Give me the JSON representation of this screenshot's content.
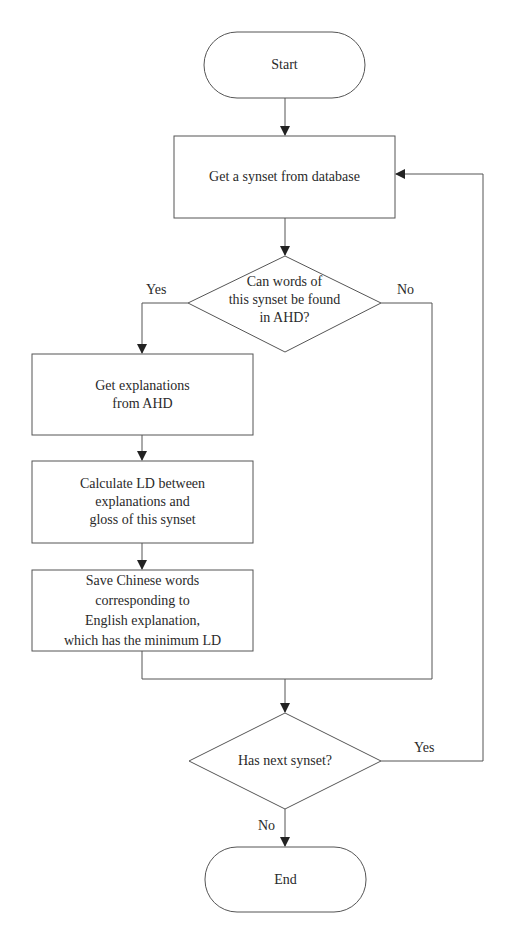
{
  "flowchart": {
    "start": "Start",
    "get_synset": "Get a synset from database",
    "decision1": {
      "line1": "Can words of",
      "line2": "this synset be found",
      "line3": "in AHD?"
    },
    "decision1_yes": "Yes",
    "decision1_no": "No",
    "get_explanations": {
      "line1": "Get explanations",
      "line2": "from AHD"
    },
    "calculate_ld": {
      "line1": "Calculate LD between",
      "line2": "explanations and",
      "line3": "gloss of this synset"
    },
    "save_words": {
      "line1": "Save Chinese words",
      "line2": "corresponding to",
      "line3": "English explanation,",
      "line4": "which has the minimum LD"
    },
    "decision2": "Has next synset?",
    "decision2_yes": "Yes",
    "decision2_no": "No",
    "end": "End"
  },
  "colors": {
    "stroke": "#555555",
    "text": "#2a2a2a",
    "background": "#ffffff"
  }
}
